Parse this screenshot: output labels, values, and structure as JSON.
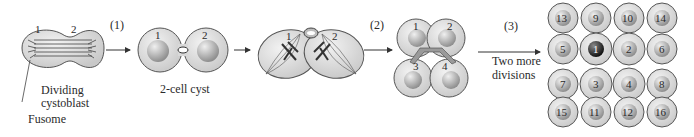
{
  "stages": [
    {
      "id": "dividing-cystoblast",
      "label_line1": "Dividing",
      "label_line2": "cystoblast",
      "cells": [
        "1",
        "2"
      ]
    },
    {
      "id": "two-cell-cyst",
      "label": "2-cell cyst",
      "cells": [
        "1",
        "2"
      ]
    },
    {
      "id": "dividing-two-cell",
      "cells": [
        "1",
        "2"
      ]
    },
    {
      "id": "four-cell-cyst",
      "cells": [
        "1",
        "2",
        "3",
        "4"
      ]
    },
    {
      "id": "sixteen-cell-cyst",
      "cells": [
        "13",
        "9",
        "10",
        "14",
        "5",
        "1",
        "2",
        "6",
        "7",
        "3",
        "4",
        "8",
        "15",
        "11",
        "12",
        "16"
      ]
    }
  ],
  "steps": [
    {
      "label": "(1)"
    },
    {
      "label": "(2)"
    },
    {
      "label": "(3)",
      "caption_line1": "Two more",
      "caption_line2": "divisions"
    }
  ],
  "callouts": {
    "fusome": "Fusome"
  },
  "colors": {
    "cell_fill": "#d6d6d6",
    "cell_stroke": "#555555",
    "nucleus": "#bdbdbd",
    "oocyte": "#3a3a3a",
    "line": "#333333"
  }
}
